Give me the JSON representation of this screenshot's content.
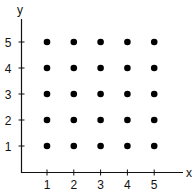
{
  "chart_data": {
    "type": "scatter",
    "title": "",
    "xlabel": "x",
    "ylabel": "y",
    "x_ticks": [
      "1",
      "2",
      "3",
      "4",
      "5"
    ],
    "y_ticks": [
      "1",
      "2",
      "3",
      "4",
      "5"
    ],
    "xlim": [
      0,
      5.8
    ],
    "ylim": [
      0,
      5.8
    ],
    "grid": false,
    "legend": null,
    "points": [
      {
        "x": 1,
        "y": 1
      },
      {
        "x": 2,
        "y": 1
      },
      {
        "x": 3,
        "y": 1
      },
      {
        "x": 4,
        "y": 1
      },
      {
        "x": 5,
        "y": 1
      },
      {
        "x": 1,
        "y": 2
      },
      {
        "x": 2,
        "y": 2
      },
      {
        "x": 3,
        "y": 2
      },
      {
        "x": 4,
        "y": 2
      },
      {
        "x": 5,
        "y": 2
      },
      {
        "x": 1,
        "y": 3
      },
      {
        "x": 2,
        "y": 3
      },
      {
        "x": 3,
        "y": 3
      },
      {
        "x": 4,
        "y": 3
      },
      {
        "x": 5,
        "y": 3
      },
      {
        "x": 1,
        "y": 4
      },
      {
        "x": 2,
        "y": 4
      },
      {
        "x": 3,
        "y": 4
      },
      {
        "x": 4,
        "y": 4
      },
      {
        "x": 5,
        "y": 4
      },
      {
        "x": 1,
        "y": 5
      },
      {
        "x": 2,
        "y": 5
      },
      {
        "x": 3,
        "y": 5
      },
      {
        "x": 4,
        "y": 5
      },
      {
        "x": 5,
        "y": 5
      }
    ],
    "colors": {
      "axis": "#111111",
      "marker": "#000000"
    }
  }
}
